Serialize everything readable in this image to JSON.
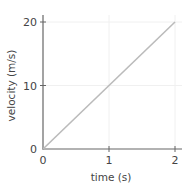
{
  "chart_data": {
    "type": "line",
    "title": "",
    "xlabel": "time (s)",
    "ylabel": "velocity (m/s)",
    "xlim": [
      0,
      2
    ],
    "ylim": [
      0,
      20
    ],
    "xticks": [
      0,
      1,
      2
    ],
    "yticks": [
      0,
      10,
      20
    ],
    "xtick_labels": [
      "0",
      "1",
      "2"
    ],
    "ytick_labels": [
      "0",
      "10",
      "20"
    ],
    "grid": true,
    "legend": null,
    "series": [
      {
        "name": "velocity",
        "x": [
          0,
          1,
          2
        ],
        "y": [
          0,
          10,
          20
        ],
        "color": "#bbbbbb"
      }
    ]
  },
  "colors": {
    "axis": "#666666",
    "grid": "#f0f0f0",
    "line": "#bbbbbb",
    "text": "#444444"
  }
}
